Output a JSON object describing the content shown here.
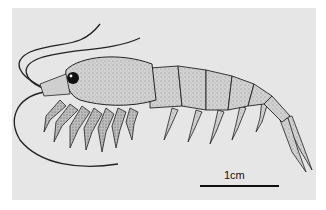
{
  "figure": {
    "background_color": "#e6e6e6",
    "ink_color": "#1a1a1a",
    "scale_bar": {
      "label": "1cm",
      "length_px": 79
    }
  }
}
